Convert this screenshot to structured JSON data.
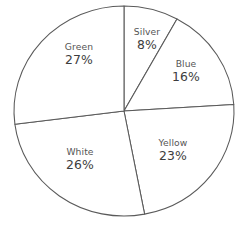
{
  "chart_data": {
    "type": "pie",
    "title": "",
    "subtitle": "",
    "xlabel": "",
    "ylabel": "",
    "legend_position": "none",
    "labels_inside": true,
    "start_angle_deg": 0,
    "direction": "clockwise",
    "categories": [
      "Silver",
      "Blue",
      "Yellow",
      "White",
      "Green"
    ],
    "values": [
      8,
      16,
      23,
      26,
      27
    ],
    "units": "%",
    "slices": [
      {
        "name": "Silver",
        "value": 8,
        "value_label": "8%",
        "color": "#ffffff",
        "stroke": "#5a5a5a"
      },
      {
        "name": "Blue",
        "value": 16,
        "value_label": "16%",
        "color": "#ffffff",
        "stroke": "#5a5a5a"
      },
      {
        "name": "Yellow",
        "value": 23,
        "value_label": "23%",
        "color": "#ffffff",
        "stroke": "#5a5a5a"
      },
      {
        "name": "White",
        "value": 26,
        "value_label": "26%",
        "color": "#ffffff",
        "stroke": "#5a5a5a"
      },
      {
        "name": "Green",
        "value": 27,
        "value_label": "27%",
        "color": "#ffffff",
        "stroke": "#5a5a5a"
      }
    ]
  },
  "chart": {
    "background": "#ffffff",
    "outline_color": "#5a5a5a",
    "fill_color": "#ffffff",
    "center_x": 124,
    "center_y": 111,
    "radius_x": 110,
    "radius_y": 105
  }
}
